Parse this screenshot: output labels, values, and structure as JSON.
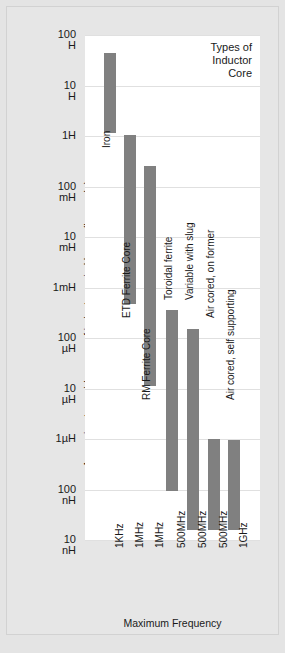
{
  "chart_data": {
    "type": "bar",
    "title": "Types of Inductor Core",
    "title_lines": [
      "Types of",
      "Inductor",
      "Core"
    ],
    "xlabel": "Maximum Frequency",
    "ylabel": "Approximate usable range of inductance in Henrys (log scale)",
    "yscale": "log",
    "ylim": [
      "10nH",
      "100H"
    ],
    "ytick_labels": [
      {
        "value": "100",
        "unit": "H"
      },
      {
        "value": "10",
        "unit": "H"
      },
      {
        "value": "1H",
        "unit": ""
      },
      {
        "value": "100",
        "unit": "mH"
      },
      {
        "value": "10",
        "unit": "mH"
      },
      {
        "value": "1mH",
        "unit": ""
      },
      {
        "value": "100",
        "unit": "µH"
      },
      {
        "value": "10",
        "unit": "µH"
      },
      {
        "value": "1µH",
        "unit": ""
      },
      {
        "value": "100",
        "unit": "nH"
      },
      {
        "value": "10",
        "unit": "nH"
      }
    ],
    "ytick_values_henrys": [
      100,
      10,
      1,
      0.1,
      0.01,
      0.001,
      0.0001,
      1e-05,
      1e-06,
      1e-07,
      1e-08
    ],
    "grid": true,
    "legend": "none",
    "bar_color": "#808080",
    "plot_background": "#ffffff",
    "categories": [
      "1KHz",
      "1MHz",
      "1MHz",
      "500MHz",
      "500MHz",
      "500MHz",
      "1GHz"
    ],
    "series_labels": [
      "Iron",
      "ETD Ferrite Core",
      "RM Ferrite Core",
      "Toroidal ferrite",
      "Variable with slug",
      "Air cored, on former",
      "Air cored, self supporting"
    ],
    "bars": [
      {
        "label": "Iron",
        "x": "1KHz",
        "high": "40H",
        "low": "1H",
        "high_h": 40,
        "low_h": 1
      },
      {
        "label": "ETD Ferrite Core",
        "x": "1MHz",
        "high": "1H",
        "low": "250µH",
        "high_h": 1,
        "low_h": 0.00025
      },
      {
        "label": "RM Ferrite Core",
        "x": "1MHz",
        "high": "250mH",
        "low": "13µH",
        "high_h": 0.25,
        "low_h": 1.3e-05
      },
      {
        "label": "Toroidal ferrite",
        "x": "500MHz",
        "high": "1.5mH",
        "low": "100nH",
        "high_h": 0.0015,
        "low_h": 1e-07
      },
      {
        "label": "Variable with slug",
        "x": "500MHz",
        "high": "1mH",
        "low": "18nH",
        "high_h": 0.001,
        "low_h": 1.8e-08
      },
      {
        "label": "Air cored, on former",
        "x": "500MHz",
        "high": "100µH",
        "low": "18nH",
        "high_h": 0.0001,
        "low_h": 1.8e-08
      },
      {
        "label": "Air cored, self supporting",
        "x": "1GHz",
        "high": "1µH",
        "low": "18nH",
        "high_h": 1e-06,
        "low_h": 1.8e-08
      }
    ]
  },
  "geometry": {
    "plot": {
      "left": 85,
      "top": 35,
      "width": 175,
      "height": 505
    },
    "decade_px": 50.5,
    "bar_width": 12,
    "bar_x": [
      104,
      124,
      144,
      166,
      187,
      208,
      228
    ],
    "bar_top": [
      53,
      135,
      166,
      310,
      329,
      439,
      440
    ],
    "bar_bottom": [
      133,
      304,
      386,
      491,
      530,
      530,
      530
    ],
    "xtick_x": [
      104,
      124,
      144,
      166,
      187,
      208,
      228
    ],
    "series_label_pos": [
      {
        "x": 101,
        "y": 148
      },
      {
        "x": 121,
        "y": 318
      },
      {
        "x": 141,
        "y": 400
      },
      {
        "x": 163,
        "y": 300
      },
      {
        "x": 184,
        "y": 300
      },
      {
        "x": 205,
        "y": 318
      },
      {
        "x": 225,
        "y": 400
      }
    ]
  }
}
